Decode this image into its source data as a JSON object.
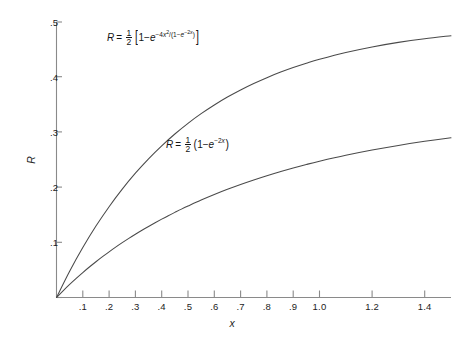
{
  "chart_data": {
    "type": "line",
    "title": "",
    "xlabel": "x",
    "ylabel": "R",
    "xlim": [
      0.0,
      1.5
    ],
    "ylim": [
      0.0,
      0.5
    ],
    "grid": false,
    "legend_position": "inline-annotations",
    "xticks": [
      0.1,
      0.2,
      0.3,
      0.4,
      0.5,
      0.6,
      0.7,
      0.8,
      0.9,
      1.0,
      1.2,
      1.4
    ],
    "xtick_labels": [
      ".1",
      ".2",
      ".3",
      ".4",
      ".5",
      ".6",
      ".7",
      ".8",
      ".9",
      "1.0",
      "1.2",
      "1.4"
    ],
    "yticks": [
      0.1,
      0.2,
      0.3,
      0.4,
      0.5
    ],
    "ytick_labels": [
      ".1",
      ".2",
      ".3",
      ".4",
      ".5"
    ],
    "series": [
      {
        "name": "R = 1/2 [1 - e^(-4x^2/(1-e^(-2x)))]",
        "formula_plain": "R = 1/2 [1 - e^{-4x^2/(1-e^{-2x})}]",
        "x": [
          0.0,
          0.025,
          0.05,
          0.075,
          0.1,
          0.125,
          0.15,
          0.175,
          0.2,
          0.225,
          0.25,
          0.275,
          0.3,
          0.325,
          0.35,
          0.375,
          0.4,
          0.425,
          0.45,
          0.475,
          0.5,
          0.55,
          0.6,
          0.65,
          0.7,
          0.75,
          0.8,
          0.85,
          0.9,
          0.95,
          1.0,
          1.1,
          1.2,
          1.3,
          1.4,
          1.5
        ],
        "y": [
          0.0,
          0.0122,
          0.0238,
          0.0348,
          0.0453,
          0.0553,
          0.0649,
          0.0741,
          0.0829,
          0.0914,
          0.0995,
          0.1073,
          0.1148,
          0.122,
          0.129,
          0.1357,
          0.1422,
          0.1485,
          0.1545,
          0.1604,
          0.166,
          0.1768,
          0.1869,
          0.1963,
          0.2051,
          0.2133,
          0.221,
          0.2282,
          0.235,
          0.2414,
          0.2473,
          0.2581,
          0.2676,
          0.276,
          0.2834,
          0.29
        ]
      },
      {
        "name": "R = 1/2 (1 - e^(-2x))",
        "formula_plain": "R = 1/2 (1 - e^{-2x})",
        "x": [
          0.0,
          0.05,
          0.1,
          0.15,
          0.2,
          0.25,
          0.3,
          0.35,
          0.4,
          0.45,
          0.5,
          0.55,
          0.6,
          0.65,
          0.7,
          0.75,
          0.8,
          0.85,
          0.9,
          0.95,
          1.0,
          1.1,
          1.2,
          1.3,
          1.4,
          1.5
        ],
        "y": [
          0.0,
          0.0476,
          0.0906,
          0.1296,
          0.1648,
          0.1967,
          0.2256,
          0.2517,
          0.2753,
          0.2967,
          0.3161,
          0.3336,
          0.3494,
          0.3638,
          0.3767,
          0.3884,
          0.399,
          0.4086,
          0.4173,
          0.4252,
          0.4323,
          0.4446,
          0.4547,
          0.463,
          0.4697,
          0.4751
        ]
      }
    ]
  },
  "axes": {
    "y_title": "R",
    "x_title": "x"
  },
  "annotations": {
    "upper": {
      "lhs": "R",
      "equals": "=",
      "num": "1",
      "den": "2",
      "bracket_open": "[",
      "one": "1",
      "minus": "−",
      "base": "e",
      "exp_minus": "−",
      "exp_coef": "4",
      "exp_var": "x",
      "exp_pow": "2",
      "exp_slash": "/",
      "exp_paren_open": "(",
      "exp_one": "1",
      "exp_inner_minus": "−",
      "exp_inner_base": "e",
      "exp_inner_minus2": "−",
      "exp_inner_coef": "2",
      "exp_inner_var": "x",
      "exp_paren_close": ")",
      "bracket_close": "]"
    },
    "lower": {
      "lhs": "R",
      "equals": "=",
      "num": "1",
      "den": "2",
      "paren_open": "(",
      "one": "1",
      "minus": "−",
      "base": "e",
      "exp_minus": "−",
      "exp_coef": "2",
      "exp_var": "x",
      "paren_close": ")"
    }
  }
}
